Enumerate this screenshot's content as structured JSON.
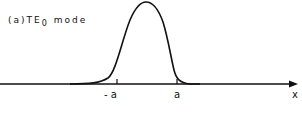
{
  "figure": {
    "title_prefix": "(a)TE",
    "title_subscript": "0",
    "title_suffix": " mode",
    "x_axis_label": "x",
    "tick_neg_label": "- a",
    "tick_pos_label": "a"
  },
  "colors": {
    "ink": "#111111",
    "background": "#ffffff"
  }
}
